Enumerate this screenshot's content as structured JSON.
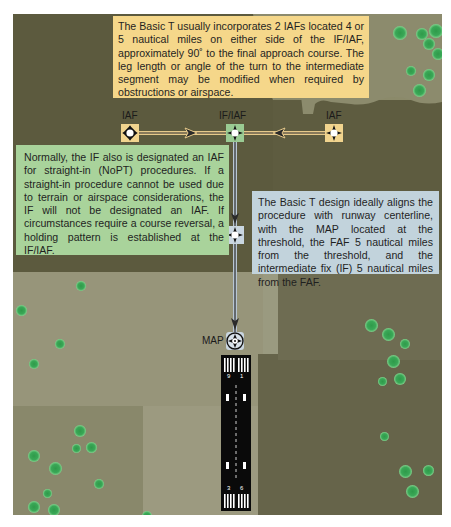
{
  "diagram": {
    "colors": {
      "yellow_callout": "#f5d78a",
      "green_callout": "#a9d39b",
      "blue_callout": "#c2d3dc",
      "iaf_box": "#f1d48e",
      "if_iaf_box": "#9acb93",
      "faf_map_box": "#c9d6e0",
      "track_line": "#2a2a2a",
      "runway": "#0a0a0a"
    },
    "callouts": {
      "top": "The Basic T usually incorporates 2 IAFs located 4 or 5 nautical miles on either side of the IF/IAF, approximately 90˚ to the final approach course. The leg length or angle of the turn to the intermediate segment may be modified when required by obstructions or airspace.",
      "left": "Normally, the IF also is designated an IAF for straight-in (NoPT) procedures. If a straight-in procedure cannot be used due to terrain or airspace considerations, the IF will not be designated an IAF. If circumstances require a course reversal, a holding pattern is established at the IF/IAF.",
      "right": "The Basic T design ideally aligns the procedure with runway centerline, with the MAP located at the threshold, the FAF 5 nautical miles from the threshold, and the intermediate fix (IF) 5 nautical miles from the FAF."
    },
    "fixes": {
      "iaf_left": "IAF",
      "if_iaf": "IF/IAF",
      "iaf_right": "IAF",
      "faf": "FAF",
      "map": "MAP"
    },
    "runway": {
      "top_number_left": "9",
      "top_number_right": "1",
      "bottom_number_left": "3",
      "bottom_number_right": "6"
    }
  }
}
